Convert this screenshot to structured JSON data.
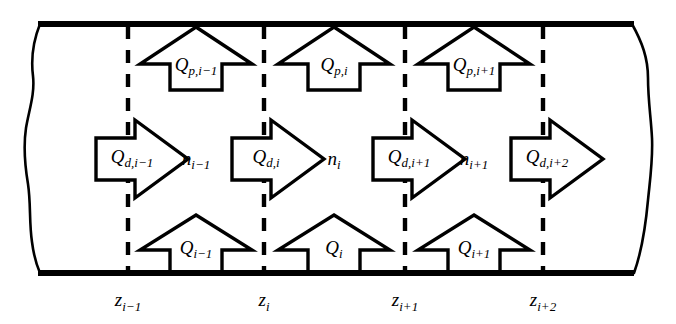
{
  "figure": {
    "name": "wellbore-segment-flow-schematic",
    "colors": {
      "stroke": "#000000",
      "fill": "#ffffff",
      "background": "#ffffff"
    }
  },
  "pipe": {
    "top_wall_label": "top-wall",
    "bottom_wall_label": "bottom-wall",
    "left_break_label": "left-break-line",
    "right_break_label": "right-break-line"
  },
  "nodes": [
    {
      "base": "z",
      "sub": "i−1",
      "x": 128
    },
    {
      "base": "z",
      "sub": "i",
      "x": 264
    },
    {
      "base": "z",
      "sub": "i+1",
      "x": 405
    },
    {
      "base": "z",
      "sub": "i+2",
      "x": 543
    }
  ],
  "segments": [
    {
      "base": "n",
      "sub": "i−1",
      "x": 196
    },
    {
      "base": "n",
      "sub": "i",
      "x": 334
    },
    {
      "base": "n",
      "sub": "i+1",
      "x": 474
    }
  ],
  "axial_flow_arrows": [
    {
      "base": "Q",
      "sub": "d,i−1",
      "x": 128,
      "label_x": 132
    },
    {
      "base": "Q",
      "sub": "d,i",
      "x": 264,
      "label_x": 266
    },
    {
      "base": "Q",
      "sub": "d,i+1",
      "x": 405,
      "label_x": 409
    },
    {
      "base": "Q",
      "sub": "d,i+2",
      "x": 543,
      "label_x": 547
    }
  ],
  "perforation_arrows": [
    {
      "base": "Q",
      "sub": "p,i−1",
      "x": 196
    },
    {
      "base": "Q",
      "sub": "p,i",
      "x": 334
    },
    {
      "base": "Q",
      "sub": "p,i+1",
      "x": 474
    }
  ],
  "reservoir_inflow_arrows": [
    {
      "base": "Q",
      "sub": "i−1",
      "x": 196
    },
    {
      "base": "Q",
      "sub": "i",
      "x": 334
    },
    {
      "base": "Q",
      "sub": "i+1",
      "x": 474
    }
  ]
}
